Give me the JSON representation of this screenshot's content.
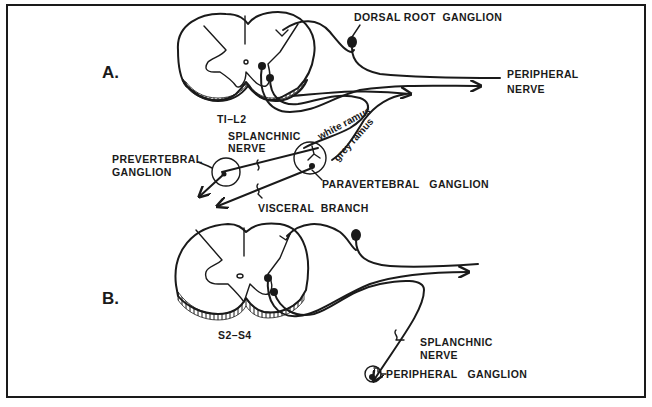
{
  "figure": {
    "panels": [
      {
        "id": "A",
        "label": "A.",
        "cord_level": "TI–L2",
        "labels": {
          "dorsal_root_ganglion": "DORSAL ROOT  GANGLION",
          "peripheral_nerve_line1": "PERIPHERAL",
          "peripheral_nerve_line2": "NERVE",
          "splanchnic_line1": "SPLANCHNIC",
          "splanchnic_line2": "NERVE",
          "prevertebral_line1": "PREVERTEBRAL",
          "prevertebral_line2": "GANGLION",
          "white_ramus": "white ramus",
          "grey_ramus": "grey ramus",
          "paravertebral_ganglion": "PARAVERTEBRAL   GANGLION",
          "visceral_branch": "VISCERAL  BRANCH"
        }
      },
      {
        "id": "B",
        "label": "B.",
        "cord_level": "S2–S4",
        "labels": {
          "splanchnic_line1": "SPLANCHNIC",
          "splanchnic_line2": "NERVE",
          "peripheral_ganglion": "PERIPHERAL   GANGLION"
        }
      }
    ],
    "colors": {
      "ink": "#1a1a1a",
      "paper": "#ffffff"
    }
  }
}
